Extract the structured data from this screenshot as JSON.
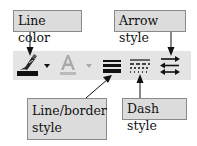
{
  "callouts": {
    "line_color": "Line color",
    "arrow_style": "Arrow style",
    "line_border_style_1": "Line/border",
    "line_border_style_2": "style",
    "dash_style": "Dash style"
  },
  "toolbar": {
    "buttons": [
      {
        "name": "line-color",
        "icon": "pen-icon",
        "has_dropdown": true
      },
      {
        "name": "font-color",
        "icon": "font-color-a-icon",
        "has_dropdown": true,
        "disabled": true
      },
      {
        "name": "line-style",
        "icon": "line-style-icon"
      },
      {
        "name": "dash-style",
        "icon": "dash-style-icon"
      },
      {
        "name": "arrow-style",
        "icon": "arrow-style-icon"
      }
    ]
  },
  "colors": {
    "toolbar_bg": "#e4e4e4",
    "callout_bg": "#dcdcdc",
    "icon_dark": "#111111",
    "icon_disabled": "#a8a8a8"
  }
}
